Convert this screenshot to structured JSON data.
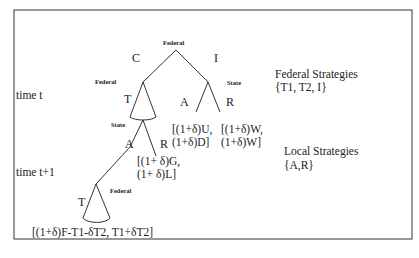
{
  "diagram": {
    "type": "game-tree",
    "nodes": {
      "root": {
        "player": "Federal"
      },
      "left_federal": {
        "player": "Federal"
      },
      "right_state": {
        "player": "State"
      },
      "left_state": {
        "player": "State"
      },
      "bottom_federal": {
        "player": "Federal"
      }
    },
    "edges": {
      "root_left": "C",
      "root_right": "I",
      "left_federal_cone": "T",
      "right_state_left": "A",
      "right_state_right": "R",
      "left_state_left": "A",
      "left_state_right": "R",
      "bottom_federal_cone": "T"
    },
    "payoffs": {
      "I_A": {
        "line1": "[(1+δ)U,",
        "line2": "(1+δ)D]"
      },
      "I_R": {
        "line1": "[(1+δ)W,",
        "line2": "(1+δ)W]"
      },
      "C_T_R": {
        "line1": "[(1+ δ)G,",
        "line2": "(1+ δ)L]"
      },
      "C_T_A_T": "[(1+δ)F-T1-δT2, T1+δT2]"
    },
    "time_labels": {
      "t": "time t",
      "t1": "time t+1"
    },
    "legend": {
      "federal_title": "Federal Strategies",
      "federal_set": "{T1, T2, I}",
      "local_title": "Local Strategies",
      "local_set": "{A,R}"
    }
  }
}
